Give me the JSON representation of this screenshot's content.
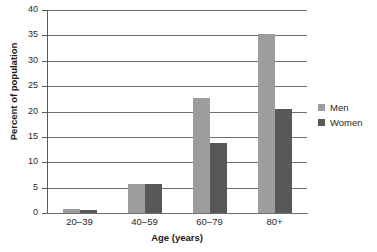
{
  "chart_data": {
    "type": "bar",
    "title": "",
    "subtitle": "",
    "xlabel": "Age (years)",
    "ylabel": "Percent of population",
    "categories": [
      "20–39",
      "40–59",
      "60–79",
      "80+"
    ],
    "series": [
      {
        "name": "Men",
        "color": "#9d9d9d",
        "values": [
          0.7,
          5.8,
          22.6,
          35.3
        ]
      },
      {
        "name": "Women",
        "color": "#585858",
        "values": [
          0.5,
          5.8,
          13.7,
          20.5
        ]
      }
    ],
    "ylim": [
      0,
      40
    ],
    "ytick_values": [
      0,
      5,
      10,
      15,
      20,
      25,
      30,
      35,
      40
    ],
    "ytick_labels": [
      "0",
      "5",
      "10",
      "15",
      "20",
      "25",
      "30",
      "35",
      "40"
    ],
    "grid": "horizontal",
    "legend_position": "right"
  },
  "legend": {
    "items": [
      {
        "label": "Men"
      },
      {
        "label": "Women"
      }
    ]
  },
  "colors": {
    "men": "#9d9d9d",
    "women": "#585858",
    "gridline": "#6e6e6e",
    "axis": "#5a5a5a",
    "background": "#ffffff",
    "text": "#1f1f1f"
  }
}
